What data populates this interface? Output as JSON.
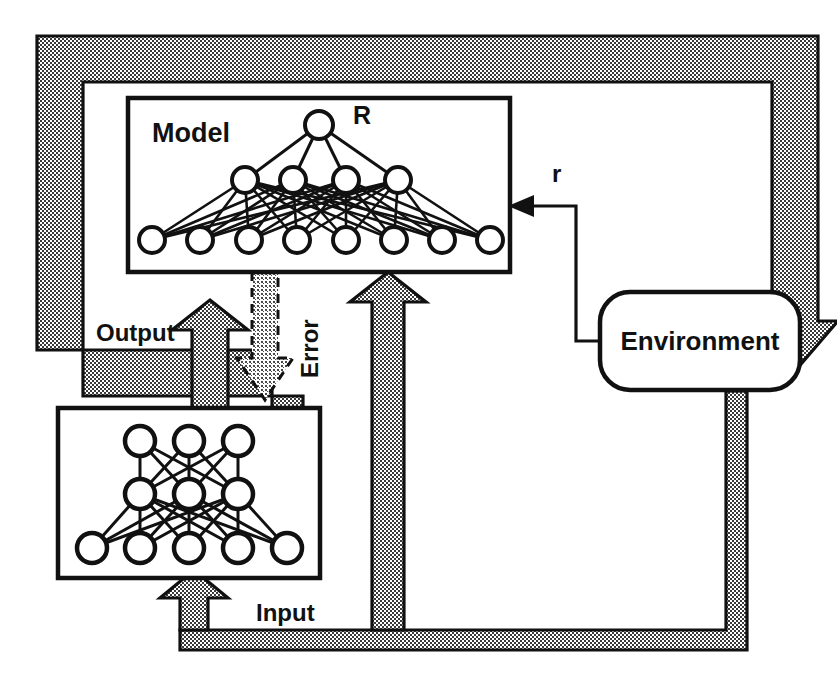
{
  "figure": {
    "type": "block-diagram",
    "background_color": "#ffffff",
    "ink_color": "#111111",
    "bus_fill_color": "#b4b4b4",
    "bus_pattern": "halftone-checkerboard"
  },
  "blocks": {
    "model": {
      "label": "Model",
      "output_node_label": "R",
      "shape": "rectangle",
      "x": 128,
      "y": 98,
      "width": 382,
      "height": 174,
      "network": {
        "layers": [
          {
            "name": "input",
            "nodes": 8
          },
          {
            "name": "hidden",
            "nodes": 4
          },
          {
            "name": "output",
            "nodes": 1
          }
        ],
        "fully_connected": true,
        "node_radius": 13
      }
    },
    "controller": {
      "label": "",
      "shape": "rectangle",
      "x": 58,
      "y": 408,
      "width": 262,
      "height": 170,
      "network": {
        "layers": [
          {
            "name": "input",
            "nodes": 5
          },
          {
            "name": "hidden",
            "nodes": 3
          },
          {
            "name": "output",
            "nodes": 3
          }
        ],
        "fully_connected": true,
        "node_radius": 15
      }
    },
    "environment": {
      "label": "Environment",
      "shape": "rounded-rectangle",
      "x": 600,
      "y": 292,
      "width": 200,
      "height": 98,
      "corner_radius": 30
    }
  },
  "signals": {
    "output": {
      "label": "Output",
      "style": "hollow-shaded-bus",
      "from": "controller",
      "to": [
        "model",
        "environment"
      ]
    },
    "input": {
      "label": "Input",
      "style": "hollow-shaded-bus",
      "from": "environment",
      "to": [
        "controller",
        "model"
      ]
    },
    "error": {
      "label": "Error",
      "style": "dashed-shaded-arrow",
      "orientation": "vertical-down",
      "label_rotation": -90,
      "from": "model",
      "to": "controller"
    },
    "reward": {
      "label": "r",
      "style": "thin-line-solid-arrowhead",
      "from": "environment",
      "to": "model"
    }
  }
}
